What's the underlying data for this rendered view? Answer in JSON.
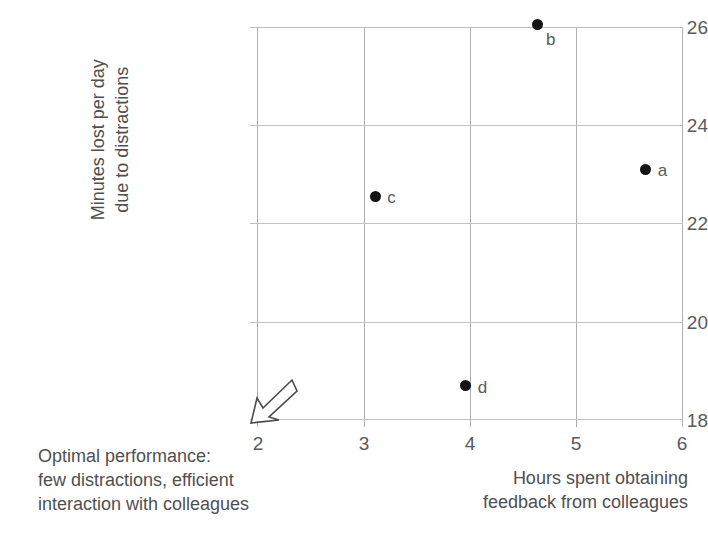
{
  "chart_data": {
    "type": "scatter",
    "title": "",
    "xlabel": "Hours spent obtaining feedback from colleagues",
    "ylabel": "Minutes lost per day due to distractions",
    "xlim": [
      2,
      6
    ],
    "ylim": [
      18,
      26
    ],
    "grid": true,
    "legend": "none",
    "xticks": [
      "2",
      "3",
      "4",
      "5",
      "6"
    ],
    "yticks": [
      "18",
      "20",
      "22",
      "24",
      "26"
    ],
    "points": [
      {
        "label": "a",
        "x": 5.65,
        "y": 23.1
      },
      {
        "label": "b",
        "x": 4.63,
        "y": 26.05
      },
      {
        "label": "c",
        "x": 3.11,
        "y": 22.55
      },
      {
        "label": "d",
        "x": 3.96,
        "y": 18.7
      }
    ],
    "annotations": [
      {
        "name": "optimal-performance-note",
        "lines": [
          "Optimal performance:",
          "few distractions, efficient",
          "interaction with colleagues"
        ],
        "arrow": "down-left-arrow-to-origin"
      }
    ],
    "colors": {
      "point": "#141414",
      "text": "#4f4f4f",
      "gridline": "#b8b8b8",
      "background": "#ffffff"
    }
  },
  "axes": {
    "y_title_lines": [
      "Minutes lost per day",
      "due to distractions"
    ],
    "x_title_lines": [
      "Hours spent obtaining",
      "feedback from colleagues"
    ]
  }
}
